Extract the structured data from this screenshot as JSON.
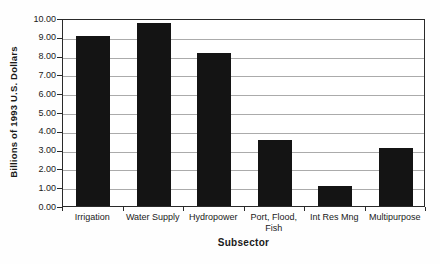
{
  "chart_data": {
    "type": "bar",
    "title": "",
    "xlabel": "Subsector",
    "ylabel": "Billions of 1993 U.S. Dollars",
    "categories": [
      "Irrigation",
      "Water Supply",
      "Hydropower",
      "Port, Flood,\nFish",
      "Int Res Mng",
      "Multipurpose"
    ],
    "values": [
      9.05,
      9.75,
      8.15,
      3.5,
      1.05,
      3.1
    ],
    "ylim": [
      0,
      10
    ],
    "ytick_step": 1,
    "ytick_labels": [
      "0.00",
      "1.00",
      "2.00",
      "3.00",
      "4.00",
      "5.00",
      "6.00",
      "7.00",
      "8.00",
      "9.00",
      "10.00"
    ],
    "grid": true,
    "legend": "none",
    "bar_color": "#141414",
    "gridline_color": "#ababab",
    "axis_color": "#2a2a2a",
    "background": "#ffffff"
  }
}
